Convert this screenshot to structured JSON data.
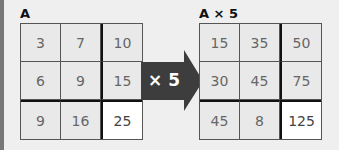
{
  "left_matrix": {
    "label": "A",
    "rows": [
      [
        "3",
        "7",
        "10"
      ],
      [
        "6",
        "9",
        "15"
      ],
      [
        "9",
        "16",
        "25"
      ]
    ]
  },
  "operation": {
    "label": "× 5",
    "color": "#3d3d3d"
  },
  "right_matrix": {
    "label": "A × 5",
    "rows": [
      [
        "15",
        "35",
        "50"
      ],
      [
        "30",
        "45",
        "75"
      ],
      [
        "45",
        "8",
        "125"
      ]
    ]
  },
  "highlight_cell": {
    "row": 2,
    "col": 2
  }
}
